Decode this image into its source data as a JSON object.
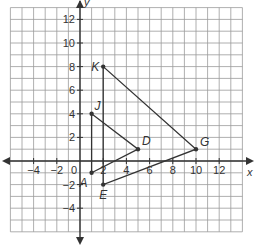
{
  "diagram": {
    "type": "coordinate-plane",
    "x_axis": {
      "label": "x",
      "min": -6,
      "max": 14,
      "tick_labels": [
        "−4",
        "−2",
        "2",
        "4",
        "6",
        "8",
        "10",
        "12"
      ],
      "tick_values": [
        -4,
        -2,
        2,
        4,
        6,
        8,
        10,
        12
      ]
    },
    "y_axis": {
      "label": "y",
      "min": -6,
      "max": 13,
      "tick_labels": [
        "12",
        "10",
        "8",
        "6",
        "4",
        "2",
        "−2",
        "−4"
      ],
      "tick_values": [
        12,
        10,
        8,
        6,
        4,
        2,
        -2,
        -4
      ]
    },
    "origin_label": "0",
    "points": [
      {
        "name": "A",
        "x": 1,
        "y": -1
      },
      {
        "name": "J",
        "x": 1,
        "y": 4
      },
      {
        "name": "D",
        "x": 5,
        "y": 1
      },
      {
        "name": "E",
        "x": 2,
        "y": -2
      },
      {
        "name": "K",
        "x": 2,
        "y": 8
      },
      {
        "name": "G",
        "x": 10,
        "y": 1
      }
    ],
    "triangles": [
      {
        "name": "AJD",
        "vertices": [
          "A",
          "J",
          "D"
        ]
      },
      {
        "name": "EKG",
        "vertices": [
          "E",
          "K",
          "G"
        ]
      }
    ],
    "colors": {
      "grid": "#9a9a9a",
      "axis": "#333333",
      "shape": "#333333",
      "background": "#ffffff"
    }
  }
}
